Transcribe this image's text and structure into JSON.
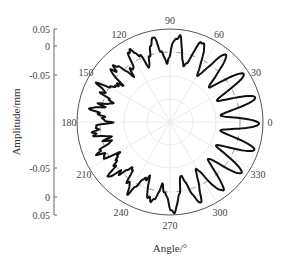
{
  "chart_data": {
    "type": "polar-line",
    "title": "",
    "xlabel": "Angle/°",
    "ylabel": "Amplitude/mm",
    "angle_ticks": [
      0,
      30,
      60,
      90,
      120,
      150,
      180,
      210,
      240,
      270,
      300,
      330
    ],
    "amplitude_axis": {
      "tick_labels_top_to_bottom": [
        "0.05",
        "0",
        "-0.05",
        "-0.05",
        "0",
        "0.05"
      ],
      "range": [
        -0.05,
        0.05
      ]
    },
    "grid": true,
    "reference_circle": "dashed mean circle at amplitude 0",
    "series": [
      {
        "name": "measured profile",
        "description": "Roundness/waviness profile with ~21 lobes; larger regular oscillations on right half (≈300°–60°), smaller irregular oscillations on left half (≈150°–270°)",
        "lobes": 21,
        "amplitude_mm_right_side": 0.045,
        "amplitude_mm_left_side": 0.02
      }
    ]
  },
  "labels": {
    "angles": [
      "0",
      "30",
      "60",
      "90",
      "120",
      "150",
      "180",
      "210",
      "240",
      "270",
      "300",
      "330"
    ],
    "amp_ticks": [
      "0.05",
      "0",
      "-0.05",
      "-0.05",
      "0",
      "0.05"
    ],
    "xlabel": "Angle/°",
    "ylabel": "Amplitude/mm"
  },
  "style": {
    "curve_color": "#111111",
    "outer_circle_color": "#555555",
    "grid_color": "#e6e6e6",
    "dash_color": "#888888"
  }
}
